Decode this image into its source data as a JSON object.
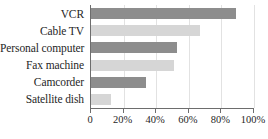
{
  "chart_data": {
    "type": "bar",
    "orientation": "horizontal",
    "title": "",
    "xlabel": "",
    "ylabel": "",
    "categories": [
      "VCR",
      "Cable TV",
      "Personal computer",
      "Fax machine",
      "Camcorder",
      "Satellite dish"
    ],
    "values": [
      89,
      67,
      53,
      51,
      34,
      12
    ],
    "value_suffix": "%",
    "xlim": [
      0,
      100
    ],
    "xticks": [
      0,
      20,
      40,
      60,
      80,
      100
    ],
    "xtick_labels": [
      "0",
      "20%",
      "40%",
      "60%",
      "80%",
      "100%"
    ],
    "grid": true,
    "grid_axis": "x",
    "legend": "none",
    "bar_colors": [
      "#8d8d8d",
      "#d6d6d6",
      "#8d8d8d",
      "#d6d6d6",
      "#8d8d8d",
      "#d6d6d6"
    ],
    "series": [
      {
        "name": "Percent of households",
        "values": [
          89,
          67,
          53,
          51,
          34,
          12
        ]
      }
    ],
    "colors": {
      "bar_dark": "#8d8d8d",
      "bar_light": "#d6d6d6",
      "axis": "#6d6d6d",
      "gridline": "#e2e2e2",
      "text": "#262626",
      "background": "#ffffff"
    }
  }
}
